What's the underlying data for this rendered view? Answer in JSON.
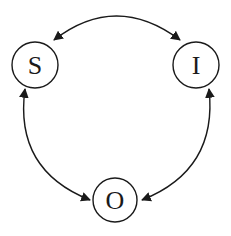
{
  "diagram": {
    "type": "cycle",
    "colors": {
      "stroke": "#1a1a1a",
      "background": "#ffffff"
    },
    "nodes": [
      {
        "id": "S",
        "label": "S",
        "cx": 35,
        "cy": 65,
        "r": 23
      },
      {
        "id": "I",
        "label": "I",
        "cx": 196,
        "cy": 65,
        "r": 23
      },
      {
        "id": "O",
        "label": "O",
        "cx": 115,
        "cy": 200,
        "r": 22
      }
    ],
    "edges": [
      {
        "from": "S",
        "to": "I",
        "bidirectional": true,
        "label": ""
      },
      {
        "from": "S",
        "to": "O",
        "bidirectional": true,
        "label": ""
      },
      {
        "from": "I",
        "to": "O",
        "bidirectional": true,
        "label": ""
      }
    ]
  }
}
